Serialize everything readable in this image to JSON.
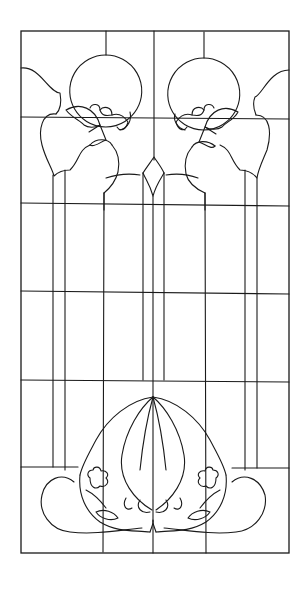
{
  "figure": {
    "type": "stained-glass-pattern",
    "width": 304,
    "height": 589,
    "colors": {
      "background": "#ffffff",
      "line": "#1a1a1a"
    },
    "frame": {
      "x": 21,
      "y": 31,
      "w": 268,
      "h": 522
    },
    "grid": {
      "horizontal": [
        {
          "x1": 21,
          "y1": 117,
          "x2": 289,
          "y2": 119
        },
        {
          "x1": 21,
          "y1": 203,
          "x2": 289,
          "y2": 206
        },
        {
          "x1": 21,
          "y1": 291,
          "x2": 289,
          "y2": 294
        },
        {
          "x1": 21,
          "y1": 380,
          "x2": 289,
          "y2": 382
        },
        {
          "x1": 21,
          "y1": 467,
          "x2": 78,
          "y2": 467
        },
        {
          "x1": 232,
          "y1": 468,
          "x2": 289,
          "y2": 468
        }
      ],
      "vertical": [
        {
          "x1": 106,
          "y1": 31,
          "x2": 106,
          "y2": 55
        },
        {
          "x1": 204,
          "y1": 32,
          "x2": 204,
          "y2": 58
        },
        {
          "x1": 154,
          "y1": 31,
          "x2": 154,
          "y2": 160
        },
        {
          "x1": 53,
          "y1": 175,
          "x2": 53,
          "y2": 467
        },
        {
          "x1": 65,
          "y1": 170,
          "x2": 65,
          "y2": 470
        },
        {
          "x1": 104,
          "y1": 193,
          "x2": 103,
          "y2": 552
        },
        {
          "x1": 143,
          "y1": 173,
          "x2": 143,
          "y2": 380
        },
        {
          "x1": 153,
          "y1": 196,
          "x2": 153,
          "y2": 553
        },
        {
          "x1": 164,
          "y1": 173,
          "x2": 164,
          "y2": 380
        },
        {
          "x1": 205,
          "y1": 193,
          "x2": 206,
          "y2": 553
        },
        {
          "x1": 245,
          "y1": 170,
          "x2": 245,
          "y2": 470
        },
        {
          "x1": 257,
          "y1": 178,
          "x2": 257,
          "y2": 468
        }
      ]
    },
    "paths": [
      "M106 55 A36 36 0 1 1 105.5 55 Z",
      "M204 58 A36 36 0 1 1 203.5 58 Z",
      "M21 68 C40 66 48 92 60 93 C62 104 60 110 56 114",
      "M289 70 C270 70 262 95 255 97 C252 104 254 110 256 115",
      "M56 114 C42 112 38 130 42 145 C46 160 52 168 54 176 C58 172 64 170 70 170 C80 160 78 150 90 145",
      "M256 115 C270 115 272 132 267 150 C262 162 258 170 257 178 C252 172 246 170 240 170 C230 160 232 150 220 145",
      "M66 110 C80 102 95 108 100 125 C95 128 88 128 84 125 C80 120 72 118 66 110",
      "M238 112 C224 104 210 110 205 127 C210 130 218 130 222 127 C226 122 234 120 238 112",
      "M90 108 C92 103 100 103 100 110",
      "M100 110 C103 106 112 106 112 115 C106 116 102 116 100 110",
      "M112 115 C118 113 124 116 128 122 C126 130 120 132 117 127",
      "M130 112 C132 120 128 128 120 130",
      "M214 108 C212 103 204 103 204 110",
      "M204 110 C201 106 192 106 192 115 C198 116 202 116 204 110",
      "M192 115 C186 113 180 116 176 122 C178 130 184 132 187 127",
      "M175 114 C173 120 177 128 185 130",
      "M100 125 L106 140 M100 125 L89 132 M106 140 C100 142 94 148 90 145",
      "M205 127 L199 142 M205 127 L216 134 M199 142 C205 144 211 150 215 146",
      "M90 145 C96 138 108 138 112 145",
      "M215 146 C208 140 196 140 192 147",
      "M112 145 C118 152 120 162 118 172 C116 180 110 188 104 193",
      "M192 147 C186 154 184 164 186 174 C188 182 194 188 205 193",
      "M104 193 L104 210",
      "M205 193 L205 210",
      "M106 178 C115 175 127 173 140 175",
      "M198 178 C190 175 178 173 166 175",
      "M143 173 C146 168 150 163 154 157 C158 163 162 168 164 173",
      "M143 173 C146 180 150 185 153 196 C156 185 160 180 164 173",
      "M153 397 C130 400 108 418 96 440 C88 455 82 465 80 475",
      "M153 397 C176 400 198 418 210 440 C218 455 224 465 226 475",
      "M153 397 C140 408 126 430 122 455 C118 480 135 500 152 510",
      "M153 397 C166 408 180 430 184 455 C188 480 171 500 156 510",
      "M153 397 C148 415 143 440 140 470",
      "M153 397 C158 415 163 440 166 470",
      "M80 475 C78 495 86 512 100 522 C118 533 135 530 150 532",
      "M226 475 C228 495 220 512 206 522 C188 533 171 530 156 532",
      "M74 482 C62 472 46 478 42 495 C38 512 50 530 70 532 C95 535 120 530 142 528",
      "M232 482 C244 472 260 478 265 495 C268 512 256 530 236 532 C211 535 186 530 164 528",
      "M150 532 C152 526 154 522 153 520 C152 522 154 526 156 532",
      "M140 500 C135 508 142 514 150 512",
      "M166 500 C171 508 164 514 156 512",
      "M90 478 C86 475 88 470 93 470 C94 466 100 466 101 471 C106 470 110 474 106 478 C110 482 106 488 100 486 C96 490 90 488 90 478 Z",
      "M216 478 C220 475 218 470 213 470 C212 466 206 466 205 471 C200 470 196 474 200 478 C196 482 200 488 206 486 C210 490 216 488 216 478 Z",
      "M86 490 C94 494 100 500 106 508",
      "M220 490 C212 494 206 500 200 508",
      "M96 512 C104 508 114 512 118 518 C110 522 100 518 96 512 Z",
      "M210 512 C202 508 192 512 188 518 C196 522 206 518 210 512 Z",
      "M126 498 C122 505 126 512 132 508",
      "M180 498 C184 505 180 512 174 508"
    ]
  }
}
